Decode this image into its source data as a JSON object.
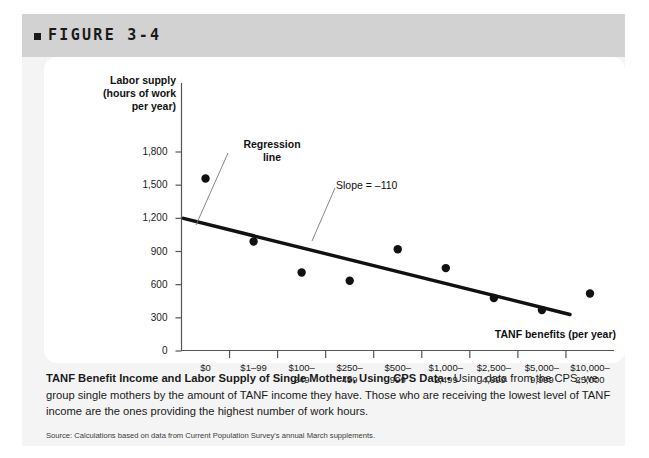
{
  "figure": {
    "number_label": "FIGURE 3-4",
    "bullet_icon": "square-bullet-icon"
  },
  "chart_data": {
    "type": "scatter",
    "title": "",
    "xlabel": "TANF benefits (per year)",
    "ylabel": "Labor supply\n(hours of work\nper year)",
    "categories": [
      "$0",
      "$1–99",
      "$100–\n249",
      "$250–\n499",
      "$500–\n999",
      "$1,000–\n2,499",
      "$2,500–\n4,999",
      "$5,000–\n9,999",
      "$10,000–\n25,000"
    ],
    "values": [
      1560,
      990,
      710,
      635,
      920,
      750,
      480,
      370,
      520
    ],
    "ylim": [
      0,
      1900
    ],
    "yticks": [
      0,
      300,
      600,
      900,
      1200,
      1500,
      1800
    ],
    "ytick_labels": [
      "0",
      "300",
      "600",
      "900",
      "1,200",
      "1,500",
      "1,800"
    ],
    "grid": false,
    "legend_position": "none",
    "series": [
      {
        "name": "Labor supply by TANF benefit group",
        "values": [
          1560,
          990,
          710,
          635,
          920,
          750,
          480,
          370,
          520
        ],
        "marker": "filled-circle",
        "color": "#111111"
      }
    ],
    "trendline": {
      "name": "Regression line",
      "slope": -110,
      "intercept": 1200,
      "y_start": 1200,
      "y_end": 330,
      "color": "#111111"
    },
    "annotations": [
      {
        "name": "regression-line-label",
        "text": "Regression\nline"
      },
      {
        "name": "slope-label",
        "text": "Slope = –110"
      }
    ]
  },
  "caption": {
    "lead": "TANF Benefit Income and Labor Supply of Single Mothers, Using CPS Data",
    "separator": " • ",
    "body": "Using data from the CPS, we group single mothers by the amount of TANF income they have. Those who are receiving the lowest level of TANF income are the ones providing the highest number of work hours.",
    "source": "Source: Calculations based on data from Current Population Survey's annual March supplements."
  }
}
